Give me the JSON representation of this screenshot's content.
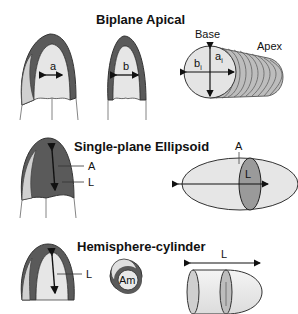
{
  "sections": [
    {
      "title": "Biplane Apical",
      "heart_labels": [
        "a",
        "b"
      ],
      "disc_stack": {
        "base_label": "Base",
        "apex_label": "Apex",
        "axis_labels": [
          "b",
          "i",
          "a",
          "i"
        ]
      }
    },
    {
      "title": "Single-plane Ellipsoid",
      "heart_labels": [
        "A",
        "L"
      ],
      "ellipsoid_labels": {
        "area": "A",
        "length": "L"
      }
    },
    {
      "title": "Hemisphere-cylinder",
      "heart_labels": [
        "L"
      ],
      "cross_section_label": "Am",
      "cylinder_label": "L"
    }
  ],
  "colors": {
    "myocardium": "#5a5a5a",
    "cavity": "#e6e6e6",
    "outline": "#333333",
    "highlight": "#8a8a8a"
  }
}
